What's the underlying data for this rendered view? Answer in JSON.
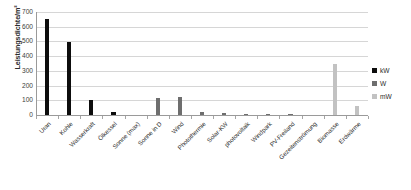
{
  "chart_data": {
    "type": "bar",
    "title": "",
    "xlabel": "",
    "ylabel": "Leistungsdichte/m²",
    "ylim": [
      0,
      700
    ],
    "yticks": [
      0,
      100,
      200,
      300,
      400,
      500,
      600,
      700
    ],
    "grid": true,
    "legend_position": "right",
    "categories": [
      "Uran",
      "Kohle",
      "Wasserkraft",
      "Ölkessel",
      "Sonne (max)",
      "Sonne in D",
      "Wind",
      "Photothermie",
      "Solar-KW",
      "photovoltaik",
      "Windpark",
      "PV-Freiland",
      "Gezeitenströmung",
      "Biomasse",
      "Erdwärme"
    ],
    "series": [
      {
        "name": "kW",
        "color": "#0d0d0d",
        "values": [
          650,
          497,
          105,
          20,
          0,
          0,
          0,
          0,
          0,
          0,
          0,
          0,
          0,
          0,
          0
        ]
      },
      {
        "name": "W",
        "color": "#6e6e6e",
        "values": [
          0,
          0,
          0,
          0,
          0,
          118,
          123,
          22,
          13,
          9,
          6,
          4,
          0,
          0,
          0
        ]
      },
      {
        "name": "mW",
        "color": "#c2c2c2",
        "values": [
          0,
          0,
          0,
          0,
          0,
          0,
          0,
          0,
          0,
          0,
          0,
          0,
          0,
          350,
          62
        ]
      }
    ]
  },
  "legend": {
    "items": [
      {
        "label": "kW",
        "color": "#0d0d0d"
      },
      {
        "label": "W",
        "color": "#6e6e6e"
      },
      {
        "label": "mW",
        "color": "#c2c2c2"
      }
    ]
  }
}
